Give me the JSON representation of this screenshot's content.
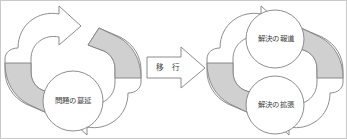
{
  "diagram": {
    "type": "cycle-transition-diagram",
    "canvas": {
      "width": 347,
      "height": 139
    },
    "colors": {
      "stroke": "#808080",
      "gray_fill": "#d0d0d0",
      "white_fill": "#ffffff",
      "text": "#3d3d3d",
      "border": "#c9c9c9",
      "background": "#ffffff"
    },
    "left_group": {
      "name": "problem-cycle",
      "nodes": [
        {
          "id": "problem-spread",
          "label": "問題の蔓延",
          "cx": 72,
          "cy": 100,
          "r": 30
        }
      ],
      "arrows": [
        {
          "id": "left-cycle-arrow-up",
          "direction": "up-right",
          "shaded": "lower"
        },
        {
          "id": "left-cycle-arrow-down",
          "direction": "down-left",
          "shaded": "upper"
        }
      ]
    },
    "transition": {
      "name": "transition-arrow",
      "label": "移 行",
      "direction": "right",
      "cx": 168,
      "cy": 67
    },
    "right_group": {
      "name": "solution-cycle",
      "nodes": [
        {
          "id": "solution-report",
          "label": "解決の報道",
          "cx": 274,
          "cy": 38,
          "r": 29
        },
        {
          "id": "solution-expansion",
          "label": "解決の拡張",
          "cx": 274,
          "cy": 104,
          "r": 29
        }
      ],
      "arrows": [
        {
          "id": "right-cycle-arrow-up",
          "direction": "up-right",
          "shaded": "lower"
        },
        {
          "id": "right-cycle-arrow-down",
          "direction": "down-left",
          "shaded": "upper"
        }
      ]
    }
  }
}
